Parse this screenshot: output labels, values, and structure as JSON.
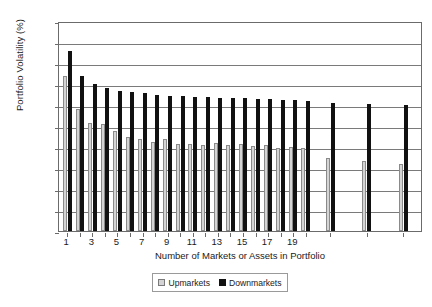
{
  "chart_data": {
    "type": "bar",
    "title": "",
    "xlabel": "Number of Markets or Assets in Portfolio",
    "ylabel": "Portfolio Volatility (%)",
    "ylim": [
      0.0,
      20.0
    ],
    "ytick_labels": [
      "0.0",
      "2.0",
      "4.0",
      "6.0",
      "8.0",
      "10.0",
      "12.0",
      "14.0",
      "16.0",
      "18.0",
      "20.0"
    ],
    "ytick_values": [
      0,
      2,
      4,
      6,
      8,
      10,
      12,
      14,
      16,
      18,
      20
    ],
    "grid": "horizontal",
    "legend_position": "bottom-center",
    "categories": [
      "1",
      "2",
      "3",
      "4",
      "5",
      "6",
      "7",
      "8",
      "9",
      "10",
      "11",
      "12",
      "13",
      "14",
      "15",
      "16",
      "17",
      "18",
      "19",
      "20",
      "25",
      "30",
      "40"
    ],
    "xtick_labels_shown": [
      "1",
      "3",
      "5",
      "7",
      "9",
      "11",
      "13",
      "15",
      "17",
      "19"
    ],
    "series": [
      {
        "name": "Upmarkets",
        "color": "#d4d4d4",
        "values": [
          14.8,
          11.6,
          10.3,
          10.2,
          9.5,
          9.0,
          8.8,
          8.5,
          8.8,
          8.3,
          8.3,
          8.2,
          8.4,
          8.2,
          8.3,
          8.1,
          8.2,
          7.9,
          8.0,
          7.9,
          7.0,
          6.7,
          6.4
        ]
      },
      {
        "name": "Downmarkets",
        "color": "#111111",
        "values": [
          17.1,
          14.8,
          14.0,
          13.6,
          13.3,
          13.2,
          13.1,
          13.0,
          12.9,
          12.9,
          12.8,
          12.8,
          12.7,
          12.7,
          12.7,
          12.6,
          12.6,
          12.5,
          12.5,
          12.4,
          12.2,
          12.1,
          12.0
        ]
      }
    ]
  },
  "legend": {
    "upmarkets_label": "Upmarkets",
    "downmarkets_label": "Downmarkets"
  }
}
